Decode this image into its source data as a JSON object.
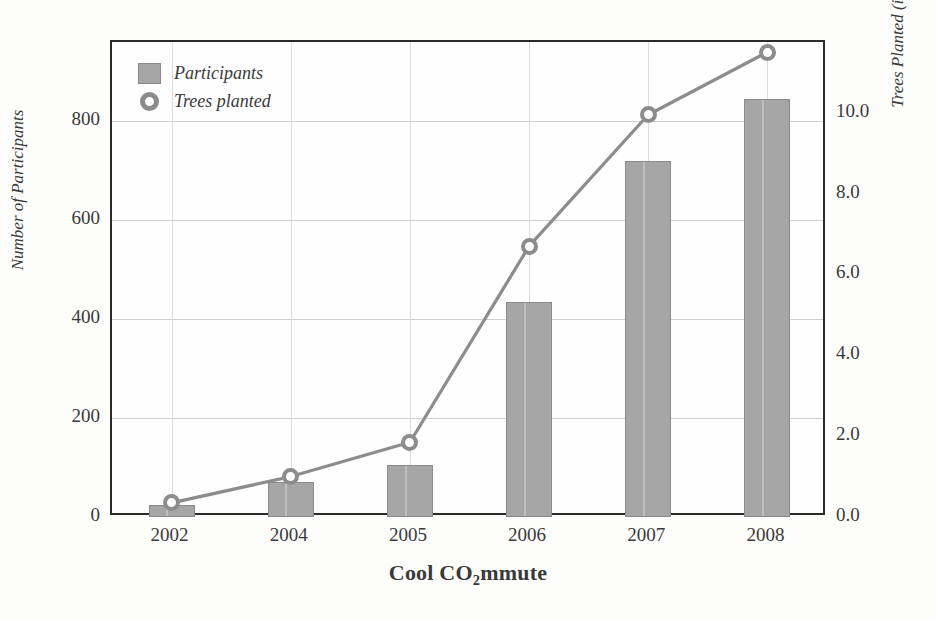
{
  "chart_data": {
    "type": "bar",
    "title": "",
    "xlabel": "Cool CO2mmute",
    "xlabel_parts": {
      "before": "Cool CO",
      "sub": "2",
      "after": "mmute"
    },
    "categories": [
      "2002",
      "2004",
      "2005",
      "2006",
      "2007",
      "2008"
    ],
    "grid": true,
    "legend_position": "top-left inside plot",
    "left_axis": {
      "label": "Number of Participants",
      "ticks": [
        "0",
        "200",
        "400",
        "600",
        "800"
      ],
      "tick_values": [
        0,
        200,
        400,
        600,
        800
      ],
      "ylim": [
        0,
        960
      ]
    },
    "right_axis": {
      "label": "Trees Planted (in thousands)",
      "ticks": [
        "0.0",
        "2.0",
        "4.0",
        "6.0",
        "8.0",
        "10.0"
      ],
      "tick_values": [
        0.0,
        2.0,
        4.0,
        6.0,
        8.0,
        10.0
      ],
      "ylim": [
        0,
        11.75
      ]
    },
    "series": [
      {
        "name": "Participants",
        "render": "bar",
        "axis": "left",
        "color": "#a6a6a6",
        "values": [
          25,
          70,
          105,
          435,
          720,
          845
        ]
      },
      {
        "name": "Trees planted",
        "render": "line",
        "axis": "right",
        "color": "#8c8c8c",
        "values": [
          0.35,
          1.0,
          1.85,
          6.7,
          9.95,
          11.5
        ]
      }
    ]
  },
  "legend": {
    "items": [
      {
        "label": "Participants",
        "marker": "square-swatch"
      },
      {
        "label": "Trees planted",
        "marker": "ring-marker"
      }
    ]
  },
  "colors": {
    "bar_fill": "#a6a6a6",
    "bar_edge": "#8a8a8a",
    "line": "#8c8c8c",
    "frame": "#2b2b2b",
    "grid": "#cfcfcf",
    "background": "#fdfdfb",
    "text": "#3a3a3a"
  }
}
